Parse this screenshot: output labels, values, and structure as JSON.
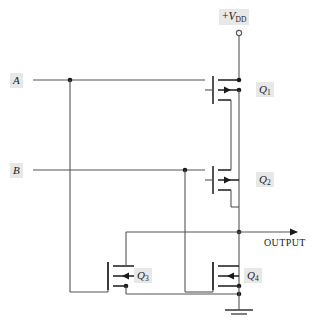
{
  "diagram": {
    "background_color": "#ffffff",
    "wire_color": "#555555",
    "device_color": "#1a1a1a",
    "label_bg_color": "#e8e8e8",
    "label_text_color": "#1a1a1a"
  },
  "supply": {
    "label_prefix": "+",
    "label_symbol": "V",
    "label_subscript": "DD",
    "terminal_type": "open-circle"
  },
  "inputs": [
    {
      "id": "A",
      "label": "A"
    },
    {
      "id": "B",
      "label": "B"
    }
  ],
  "output": {
    "label": "OUTPUT",
    "arrow": "right"
  },
  "ground": {
    "symbol": "earth-ground",
    "bars": 2
  },
  "transistors": [
    {
      "id": "Q1",
      "label": "Q",
      "subscript": "1",
      "type": "pmos",
      "arrow_direction": "right",
      "gate_side": "left"
    },
    {
      "id": "Q2",
      "label": "Q",
      "subscript": "2",
      "type": "pmos",
      "arrow_direction": "right",
      "gate_side": "left"
    },
    {
      "id": "Q3",
      "label": "Q",
      "subscript": "3",
      "type": "nmos",
      "arrow_direction": "left",
      "gate_side": "left"
    },
    {
      "id": "Q4",
      "label": "Q",
      "subscript": "4",
      "type": "nmos",
      "arrow_direction": "left",
      "gate_side": "left"
    }
  ]
}
